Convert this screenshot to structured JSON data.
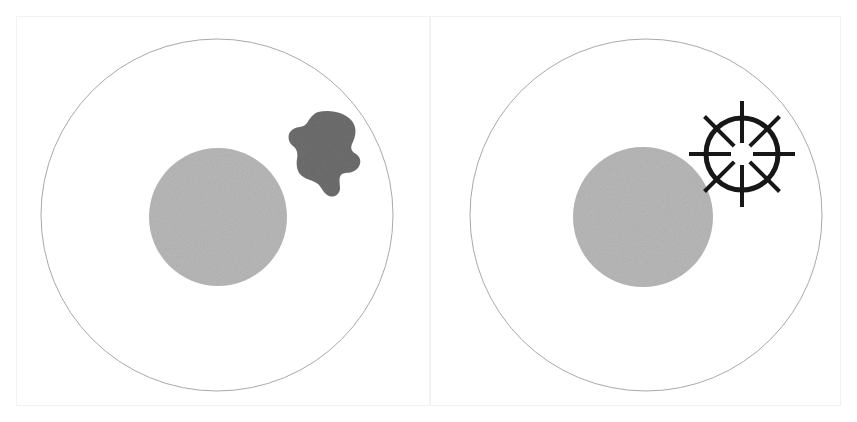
{
  "figure": {
    "title": "",
    "canvas": {
      "width": 857,
      "height": 422,
      "background": "#ffffff"
    },
    "frame_color": "#f2f2f2"
  },
  "colors": {
    "outline": "#a9a9a9",
    "inner_disc": "#b9b9b9",
    "dark_blob": "#6f6f6f",
    "starburst": "#171717",
    "background": "#ffffff"
  },
  "panels": [
    {
      "id": "panel-left",
      "name": "left-panel",
      "label": "",
      "outer_circle": {
        "cx": 217,
        "cy": 215,
        "r": 176,
        "stroke": "#a9a9a9",
        "stroke_width": 1,
        "fill": "#ffffff"
      },
      "inner_disc": {
        "cx": 218,
        "cy": 217,
        "r": 69,
        "fill": "#b9b9b9"
      },
      "marker": {
        "type": "irregular-blob",
        "name": "dark-blob",
        "cx": 325,
        "cy": 152,
        "width": 62,
        "height": 80,
        "fill": "#6f6f6f"
      }
    },
    {
      "id": "panel-right",
      "name": "right-panel",
      "label": "",
      "outer_circle": {
        "cx": 646,
        "cy": 215,
        "r": 176,
        "stroke": "#a9a9a9",
        "stroke_width": 1,
        "fill": "#ffffff"
      },
      "inner_disc": {
        "cx": 643,
        "cy": 217,
        "r": 70,
        "fill": "#b9b9b9"
      },
      "marker": {
        "type": "starburst-ring",
        "name": "starburst-marker",
        "cx": 742,
        "cy": 154,
        "ring_radius": 36,
        "ring_stroke_width": 5,
        "ray_count": 8,
        "ray_inner_radius": 11,
        "ray_outer_radius": 53,
        "ray_stroke_width": 4,
        "ray_angles_deg": [
          -90,
          -45,
          0,
          45,
          90,
          135,
          180,
          225
        ],
        "color": "#171717"
      }
    }
  ]
}
